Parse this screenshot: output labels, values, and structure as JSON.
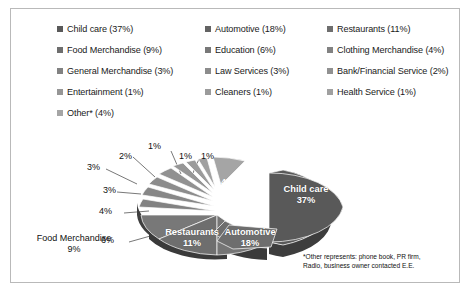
{
  "chart_data": {
    "type": "pie",
    "title": "",
    "legend_position": "top",
    "categories": [
      "Child care",
      "Automotive",
      "Restaurants",
      "Food Merchandise",
      "Education",
      "Clothing Merchandise",
      "General Merchandise",
      "Law Services",
      "Bank/Financial Service",
      "Entertainment",
      "Cleaners",
      "Health Service",
      "Other*"
    ],
    "values": [
      37,
      18,
      11,
      9,
      6,
      4,
      3,
      3,
      2,
      1,
      1,
      1,
      4
    ],
    "value_suffix": "%",
    "exploded": [
      "Child care",
      "Automotive"
    ],
    "three_d": true,
    "colors": [
      "#595959",
      "#6e6e6e",
      "#757575",
      "#787878",
      "#7d7d7d",
      "#828282",
      "#878787",
      "#8c8c8c",
      "#919191",
      "#969696",
      "#9b9b9b",
      "#a0a0a0",
      "#a5a5a5"
    ],
    "annotations": [
      "*Other represents: phone book, PR firm, Radio, business owner contacted E.E."
    ]
  },
  "legend": {
    "items": [
      {
        "label": "Child care (37%)",
        "color": "#595959",
        "column": "a"
      },
      {
        "label": "Automotive (18%)",
        "color": "#636363",
        "column": "b"
      },
      {
        "label": "Restaurants (11%)",
        "color": "#6e6e6e",
        "column": "c"
      },
      {
        "label": "Food Merchandise (9%)",
        "color": "#6e6e6e",
        "column": "a"
      },
      {
        "label": "Education (6%)",
        "color": "#787878",
        "column": "b"
      },
      {
        "label": "Clothing Merchandise (4%)",
        "color": "#828282",
        "column": "c"
      },
      {
        "label": "General Merchandise (3%)",
        "color": "#828282",
        "column": "a"
      },
      {
        "label": "Law Services (3%)",
        "color": "#8c8c8c",
        "column": "b"
      },
      {
        "label": "Bank/Financial Service (2%)",
        "color": "#919191",
        "column": "c"
      },
      {
        "label": "Entertainment (1%)",
        "color": "#969696",
        "column": "a"
      },
      {
        "label": "Cleaners (1%)",
        "color": "#9b9b9b",
        "column": "b"
      },
      {
        "label": "Health Service (1%)",
        "color": "#a0a0a0",
        "column": "c"
      },
      {
        "label": "Other* (4%)",
        "color": "#a5a5a5",
        "column": "a"
      }
    ]
  },
  "pie_labels": {
    "child_care": "Child care",
    "child_care_pct": "37%",
    "automotive": "Automotive",
    "automotive_pct": "18%",
    "restaurants": "Restaurants",
    "restaurants_pct": "11%",
    "food_merchandise": "Food Merchandise",
    "food_merchandise_pct": "9%"
  },
  "callouts": {
    "c6": "6%",
    "c4": "4%",
    "c3a": "3%",
    "c3b": "3%",
    "c2": "2%",
    "c1a": "1%",
    "c1b": "1%",
    "c1c": "1%",
    "other4": "4%"
  },
  "footnote": {
    "line1": "*Other represents: phone book, PR firm,",
    "line2": "Radio, business owner contacted E.E."
  }
}
